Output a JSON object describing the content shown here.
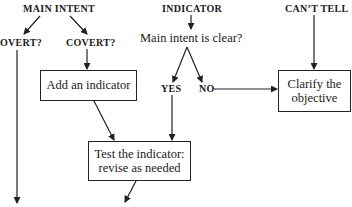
{
  "diagram": {
    "type": "flowchart",
    "nodes": {
      "main_intent": "MAIN INTENT",
      "overt": "OVERT?",
      "covert": "COVERT?",
      "indicator": "INDICATOR",
      "question": "Main intent is clear?",
      "yes": "YES",
      "no": "NO",
      "cant_tell": "CAN’T TELL",
      "add_indicator": "Add an indicator",
      "clarify_line1": "Clarify the",
      "clarify_line2": "objective",
      "test_line1": "Test the indicator:",
      "test_line2": "revise as needed"
    },
    "edges": [
      {
        "from": "MAIN INTENT",
        "to": "OVERT?"
      },
      {
        "from": "MAIN INTENT",
        "to": "COVERT?"
      },
      {
        "from": "COVERT?",
        "to": "Add an indicator"
      },
      {
        "from": "OVERT?",
        "to": "(continues below)"
      },
      {
        "from": "INDICATOR",
        "to": "Main intent is clear?"
      },
      {
        "from": "Main intent is clear?",
        "to": "YES"
      },
      {
        "from": "Main intent is clear?",
        "to": "NO"
      },
      {
        "from": "NO",
        "to": "Clarify the objective"
      },
      {
        "from": "CAN’T TELL",
        "to": "Clarify the objective"
      },
      {
        "from": "YES",
        "to": "Test the indicator: revise as needed"
      },
      {
        "from": "Add an indicator",
        "to": "Test the indicator: revise as needed"
      },
      {
        "from": "Test the indicator: revise as needed",
        "to": "(continues below)"
      }
    ]
  }
}
